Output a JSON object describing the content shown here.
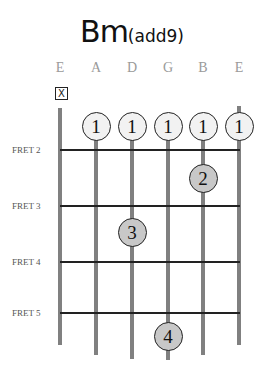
{
  "chord": {
    "root": "Bm",
    "extension": "(add9)"
  },
  "strings": [
    {
      "name": "E",
      "x": 60,
      "bottom": 345
    },
    {
      "name": "A",
      "x": 96,
      "bottom": 355
    },
    {
      "name": "D",
      "x": 132,
      "bottom": 359
    },
    {
      "name": "G",
      "x": 168,
      "bottom": 360
    },
    {
      "name": "B",
      "x": 203,
      "bottom": 355
    },
    {
      "name": "E",
      "x": 239,
      "bottom": 345
    }
  ],
  "muted": {
    "string": 1,
    "symbol": "X"
  },
  "frets": [
    {
      "label": "FRET 2",
      "y": 150
    },
    {
      "label": "FRET 3",
      "y": 206
    },
    {
      "label": "FRET 4",
      "y": 262
    },
    {
      "label": "FRET 5",
      "y": 313
    }
  ],
  "fingers": [
    {
      "finger": "1",
      "string": 2,
      "x": 96,
      "y": 126,
      "style": "open"
    },
    {
      "finger": "1",
      "string": 3,
      "x": 132,
      "y": 126,
      "style": "open"
    },
    {
      "finger": "1",
      "string": 4,
      "x": 168,
      "y": 126,
      "style": "open"
    },
    {
      "finger": "1",
      "string": 5,
      "x": 203,
      "y": 126,
      "style": "open"
    },
    {
      "finger": "1",
      "string": 6,
      "x": 239,
      "y": 126,
      "style": "open"
    },
    {
      "finger": "2",
      "string": 5,
      "x": 203,
      "y": 178,
      "style": "fretted"
    },
    {
      "finger": "3",
      "string": 3,
      "x": 132,
      "y": 232,
      "style": "fretted"
    },
    {
      "finger": "4",
      "string": 4,
      "x": 168,
      "y": 336,
      "style": "fretted"
    }
  ]
}
